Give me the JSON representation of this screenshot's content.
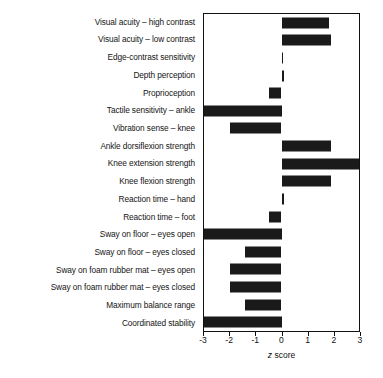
{
  "chart_data": {
    "type": "bar",
    "orientation": "horizontal",
    "title": "",
    "xlabel": "z score",
    "ylabel": "",
    "xlim": [
      -3,
      3
    ],
    "xticks": [
      -3,
      -2,
      -1,
      0,
      1,
      2,
      3
    ],
    "xtick_labels": [
      "-3",
      "-2",
      "-1",
      "0",
      "1",
      "2",
      "3"
    ],
    "grid": false,
    "legend": null,
    "bar_color": "#1a1a1a",
    "axis_color": "#111111",
    "categories": [
      "Visual acuity – high contrast",
      "Visual acuity – low contrast",
      "Edge-contrast sensitivity",
      "Depth perception",
      "Proprioception",
      "Tactile sensitivity – ankle",
      "Vibration sense – knee",
      "Ankle dorsiflexion strength",
      "Knee extension strength",
      "Knee flexion strength",
      "Reaction time – hand",
      "Reaction time – foot",
      "Sway on floor – eyes open",
      "Sway on floor – eyes closed",
      "Sway on foam rubber mat – eyes open",
      "Sway on foam rubber mat – eyes closed",
      "Maximum balance range",
      "Coordinated stability"
    ],
    "values": [
      1.85,
      1.9,
      0.03,
      0.08,
      -0.5,
      -3.0,
      -2.0,
      1.9,
      3.0,
      1.9,
      0.08,
      -0.5,
      -3.0,
      -1.4,
      -2.0,
      -2.0,
      -1.4,
      -3.0
    ]
  },
  "axis": {
    "title_prefix": "z",
    "title_suffix": " score"
  }
}
